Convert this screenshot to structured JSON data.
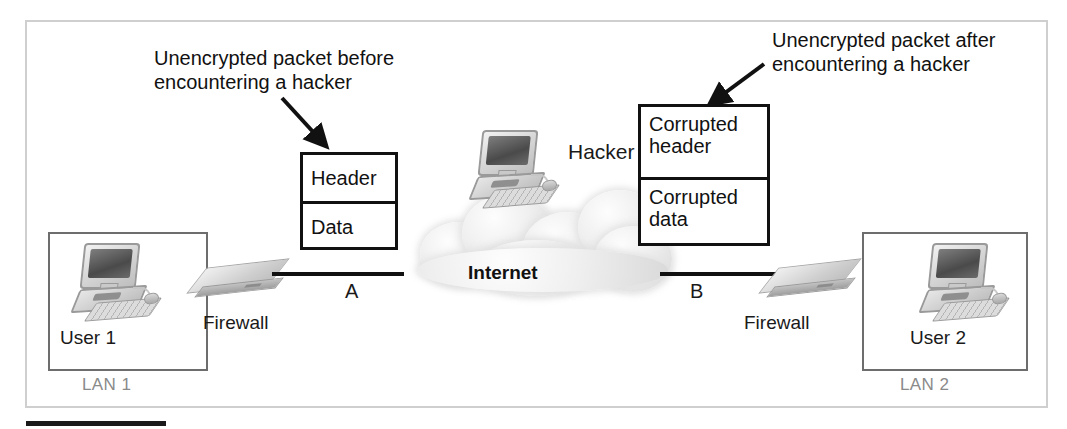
{
  "diagram": {
    "annotations": {
      "left": "Unencrypted packet before encountering a hacker",
      "right": "Unencrypted packet after encountering a hacker"
    },
    "packets": [
      {
        "id": "plain",
        "name": "unencrypted-packet",
        "fields": [
          "Header",
          "Data"
        ]
      },
      {
        "id": "corrupt",
        "name": "corrupted-packet",
        "fields": [
          "Corrupted header",
          "Corrupted data"
        ]
      }
    ],
    "cloud": {
      "label": "Internet"
    },
    "hacker": {
      "label": "Hacker"
    },
    "lans": [
      {
        "id": "lan1",
        "label": "LAN 1",
        "user": "User 1",
        "firewall": "Firewall"
      },
      {
        "id": "lan2",
        "label": "LAN 2",
        "user": "User 2",
        "firewall": "Firewall"
      }
    ],
    "links": [
      {
        "id": "a",
        "label": "A"
      },
      {
        "id": "b",
        "label": "B"
      }
    ],
    "colors": {
      "line": "#111111",
      "lan_border": "#6d6d6d",
      "lan_label": "#8a8a8a",
      "outer_frame": "#cfcfcf",
      "cloud": "#e6e6e6"
    }
  }
}
